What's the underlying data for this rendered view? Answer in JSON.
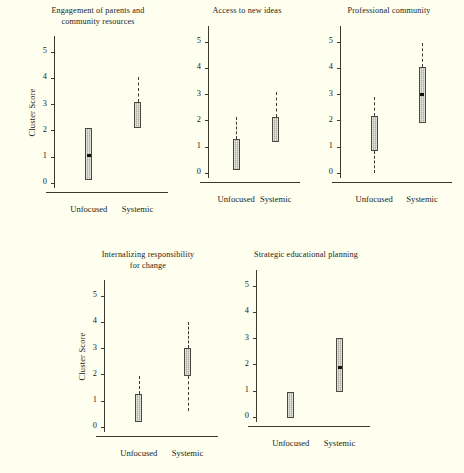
{
  "figure": {
    "background_color": "#fffff0",
    "axis_color": "#3a3a32",
    "box_fill_color": "#c6c6ba",
    "box_edge_color": "#4a4a40",
    "median_color": "#121210",
    "shared_ylabel": "Cluster Score",
    "shared_ytick_labels": [
      "0",
      "1",
      "2",
      "3",
      "4",
      "5"
    ],
    "shared_xtick_labels": [
      "Unfocused",
      "Systemic"
    ]
  },
  "chart_data": [
    {
      "type": "box",
      "panel_index": 0,
      "title": "Engagement of parents and\ncommunity resources",
      "title_line1": "Engagement of parents and",
      "title_line2": "community resources",
      "xlabel": "",
      "ylabel": "Cluster Score",
      "ylim": [
        -0.35,
        5.6
      ],
      "yticks": [
        0,
        1,
        2,
        3,
        4,
        5
      ],
      "categories": [
        "Unfocused",
        "Systemic"
      ],
      "boxes": [
        {
          "category": "Unfocused",
          "q1": 0.12,
          "q3": 2.08,
          "median": 1.05,
          "whisker_low": null,
          "whisker_high": null,
          "median_marker": true
        },
        {
          "category": "Systemic",
          "q1": 2.08,
          "q3": 3.1,
          "median": null,
          "whisker_low": null,
          "whisker_high": 4.05,
          "median_marker": false
        }
      ]
    },
    {
      "type": "box",
      "panel_index": 1,
      "title": "Access to new ideas",
      "title_line1": "Access to new ideas",
      "title_line2": "",
      "xlabel": "",
      "ylabel": "",
      "ylim": [
        -0.35,
        5.6
      ],
      "yticks": [
        0,
        1,
        2,
        3,
        4,
        5
      ],
      "categories": [
        "Unfocused",
        "Systemic"
      ],
      "boxes": [
        {
          "category": "Unfocused",
          "q1": 0.1,
          "q3": 1.28,
          "median": null,
          "whisker_low": null,
          "whisker_high": 2.12,
          "median_marker": false
        },
        {
          "category": "Systemic",
          "q1": 1.18,
          "q3": 2.12,
          "median": null,
          "whisker_low": null,
          "whisker_high": 3.1,
          "median_marker": false
        }
      ]
    },
    {
      "type": "box",
      "panel_index": 2,
      "title": "Professional community",
      "title_line1": "Professional community",
      "title_line2": "",
      "xlabel": "",
      "ylabel": "",
      "ylim": [
        -0.35,
        5.6
      ],
      "yticks": [
        0,
        1,
        2,
        3,
        4,
        5
      ],
      "categories": [
        "Unfocused",
        "Systemic"
      ],
      "boxes": [
        {
          "category": "Unfocused",
          "q1": 0.85,
          "q3": 2.15,
          "median": null,
          "whisker_low": 0.0,
          "whisker_high": 2.9,
          "median_marker": false
        },
        {
          "category": "Systemic",
          "q1": 1.9,
          "q3": 4.05,
          "median": 3.0,
          "whisker_low": null,
          "whisker_high": 4.95,
          "median_marker": true
        }
      ]
    },
    {
      "type": "box",
      "panel_index": 3,
      "title": "Internalizing responsibility\nfor change",
      "title_line1": "Internalizing responsibility",
      "title_line2": "for change",
      "xlabel": "",
      "ylabel": "Cluster Score",
      "ylim": [
        -0.35,
        5.6
      ],
      "yticks": [
        0,
        1,
        2,
        3,
        4,
        5
      ],
      "categories": [
        "Unfocused",
        "Systemic"
      ],
      "boxes": [
        {
          "category": "Unfocused",
          "q1": 0.18,
          "q3": 1.25,
          "median": null,
          "whisker_low": null,
          "whisker_high": 1.92,
          "median_marker": false
        },
        {
          "category": "Systemic",
          "q1": 1.95,
          "q3": 3.0,
          "median": null,
          "whisker_low": 0.62,
          "whisker_high": 4.0,
          "median_marker": false
        }
      ]
    },
    {
      "type": "box",
      "panel_index": 4,
      "title": "Strategic educational planning",
      "title_line1": "Strategic educational planning",
      "title_line2": "",
      "xlabel": "",
      "ylabel": "",
      "ylim": [
        -0.35,
        5.6
      ],
      "yticks": [
        0,
        1,
        2,
        3,
        4,
        5
      ],
      "categories": [
        "Unfocused",
        "Systemic"
      ],
      "boxes": [
        {
          "category": "Unfocused",
          "q1": -0.05,
          "q3": 0.95,
          "median": null,
          "whisker_low": null,
          "whisker_high": null,
          "median_marker": false
        },
        {
          "category": "Systemic",
          "q1": 0.95,
          "q3": 3.0,
          "median": 1.9,
          "whisker_low": null,
          "whisker_high": null,
          "median_marker": true
        }
      ]
    }
  ],
  "panel_layout": [
    {
      "left": 22,
      "top": 6,
      "width": 152,
      "height": 218,
      "show_ylabel": true,
      "title_lines": 2
    },
    {
      "left": 188,
      "top": 6,
      "width": 118,
      "height": 218,
      "show_ylabel": false,
      "title_lines": 1
    },
    {
      "left": 320,
      "top": 6,
      "width": 138,
      "height": 218,
      "show_ylabel": false,
      "title_lines": 1
    },
    {
      "left": 72,
      "top": 250,
      "width": 152,
      "height": 218,
      "show_ylabel": true,
      "title_lines": 2
    },
    {
      "left": 236,
      "top": 250,
      "width": 140,
      "height": 218,
      "show_ylabel": false,
      "title_lines": 1
    }
  ]
}
